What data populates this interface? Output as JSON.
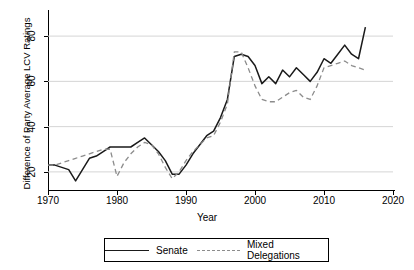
{
  "chart_data": {
    "type": "line",
    "title": "",
    "xlabel": "Year",
    "ylabel": "Difference of Party Average LCV Ratings",
    "xlim": [
      1970,
      2020
    ],
    "ylim": [
      12,
      88
    ],
    "xticks": [
      1970,
      1980,
      1990,
      2000,
      2010,
      2020
    ],
    "yticks": [
      20,
      40,
      60,
      80
    ],
    "grid": "horizontal",
    "legend_position": "bottom",
    "series": [
      {
        "name": "Senate",
        "style": "solid",
        "color": "#1a1a1a",
        "x": [
          1970,
          1971,
          1972,
          1973,
          1974,
          1975,
          1976,
          1977,
          1978,
          1979,
          1980,
          1981,
          1982,
          1983,
          1984,
          1985,
          1986,
          1987,
          1988,
          1989,
          1990,
          1991,
          1992,
          1993,
          1994,
          1995,
          1996,
          1997,
          1998,
          1999,
          2000,
          2001,
          2002,
          2003,
          2004,
          2005,
          2006,
          2007,
          2008,
          2009,
          2010,
          2011,
          2012,
          2013,
          2014,
          2015,
          2016
        ],
        "y": [
          23,
          23,
          22,
          21,
          16,
          21,
          26,
          27,
          29,
          31,
          31,
          31,
          31,
          33,
          35,
          32,
          29,
          25,
          19,
          19,
          23,
          28,
          32,
          36,
          38,
          44,
          52,
          71,
          72,
          71,
          67,
          59,
          62,
          59,
          65,
          62,
          66,
          63,
          60,
          64,
          70,
          68,
          72,
          76,
          72,
          70,
          84
        ]
      },
      {
        "name": "Mixed Delegations",
        "style": "dashed",
        "color": "#8c8c8c",
        "x": [
          1970,
          1971,
          1972,
          1973,
          1974,
          1975,
          1976,
          1977,
          1978,
          1979,
          1980,
          1981,
          1982,
          1983,
          1984,
          1985,
          1986,
          1987,
          1988,
          1989,
          1990,
          1991,
          1992,
          1993,
          1994,
          1995,
          1996,
          1997,
          1998,
          1999,
          2000,
          2001,
          2002,
          2003,
          2004,
          2005,
          2006,
          2007,
          2008,
          2009,
          2010,
          2011,
          2012,
          2013,
          2014,
          2015,
          2016
        ],
        "y": [
          23,
          23,
          24,
          25,
          26,
          27,
          28,
          29,
          30,
          30,
          18,
          24,
          28,
          31,
          33,
          32,
          28,
          22,
          17,
          20,
          25,
          29,
          32,
          35,
          36,
          42,
          50,
          73,
          73,
          66,
          58,
          52,
          51,
          51,
          53,
          55,
          56,
          53,
          52,
          58,
          66,
          67,
          68,
          69,
          67,
          66,
          65
        ]
      }
    ]
  },
  "axis": {
    "y_tick_labels": [
      "20",
      "40",
      "60",
      "80"
    ],
    "x_tick_labels": [
      "1970",
      "1980",
      "1990",
      "2000",
      "2010",
      "2020"
    ],
    "y_axis_title": "Difference of Party Average LCV Ratings",
    "x_axis_title": "Year"
  },
  "legend": {
    "items": [
      {
        "label": "Senate",
        "style": "solid"
      },
      {
        "label": "Mixed Delegations",
        "style": "dashed"
      }
    ]
  }
}
